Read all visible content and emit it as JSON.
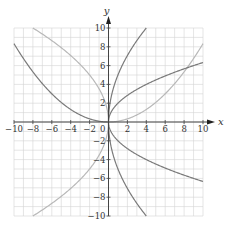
{
  "chart_data": {
    "type": "line",
    "title": "",
    "xlabel": "x",
    "ylabel": "y",
    "xlim": [
      -10,
      10
    ],
    "ylim": [
      -10,
      10
    ],
    "grid": true,
    "grid_step": 1,
    "x_ticks": [
      -10,
      -8,
      -6,
      -4,
      -2,
      2,
      4,
      6,
      8,
      10
    ],
    "y_ticks": [
      -10,
      -8,
      -6,
      -4,
      -2,
      2,
      4,
      6,
      8,
      10
    ],
    "origin_label": "0",
    "colors": {
      "dark_curve": "#7a7a7a",
      "light_curve": "#b8b8b8",
      "grid": "#d4d4d4",
      "axis": "#444444"
    },
    "series": [
      {
        "name": "y = x²/12",
        "color_role": "light_curve",
        "domain": [
          0,
          10
        ],
        "points": [
          [
            0,
            0
          ],
          [
            2,
            0.33
          ],
          [
            4,
            1.33
          ],
          [
            6,
            3
          ],
          [
            8,
            5.33
          ],
          [
            10,
            8.33
          ]
        ]
      },
      {
        "name": "y = x²/12 (left)",
        "color_role": "dark_curve",
        "domain": [
          -10,
          0
        ],
        "points": [
          [
            -10,
            8.33
          ],
          [
            -8,
            5.33
          ],
          [
            -6,
            3
          ],
          [
            -4,
            1.33
          ],
          [
            -2,
            0.33
          ],
          [
            0,
            0
          ]
        ]
      },
      {
        "name": "y = 2√x",
        "color_role": "dark_curve",
        "domain": [
          0,
          10
        ],
        "points": [
          [
            0,
            0
          ],
          [
            1,
            2
          ],
          [
            4,
            4
          ],
          [
            9,
            6
          ],
          [
            10,
            6.32
          ]
        ]
      },
      {
        "name": "y = -2√x",
        "color_role": "dark_curve",
        "domain": [
          0,
          10
        ],
        "points": [
          [
            0,
            0
          ],
          [
            1,
            -2
          ],
          [
            4,
            -4
          ],
          [
            9,
            -6
          ],
          [
            10,
            -6.32
          ]
        ]
      },
      {
        "name": "y = 5√x",
        "color_role": "dark_curve",
        "domain": [
          0,
          4
        ],
        "points": [
          [
            0,
            0
          ],
          [
            1,
            5
          ],
          [
            2.25,
            7.5
          ],
          [
            4,
            10
          ]
        ]
      },
      {
        "name": "y = -5√x",
        "color_role": "dark_curve",
        "domain": [
          0,
          4
        ],
        "points": [
          [
            0,
            0
          ],
          [
            1,
            -5
          ],
          [
            2.25,
            -7.5
          ],
          [
            4,
            -10
          ]
        ]
      },
      {
        "name": "y = √(-12.5x)",
        "color_role": "light_curve",
        "domain": [
          -8,
          0
        ],
        "points": [
          [
            -8,
            10
          ],
          [
            -4.5,
            7.5
          ],
          [
            -2,
            5
          ],
          [
            -0.5,
            2.5
          ],
          [
            0,
            0
          ]
        ]
      },
      {
        "name": "y = -√(-12.5x)",
        "color_role": "light_curve",
        "domain": [
          -8,
          0
        ],
        "points": [
          [
            -8,
            -10
          ],
          [
            -4.5,
            -7.5
          ],
          [
            -2,
            -5
          ],
          [
            -0.5,
            -2.5
          ],
          [
            0,
            0
          ]
        ]
      }
    ]
  }
}
